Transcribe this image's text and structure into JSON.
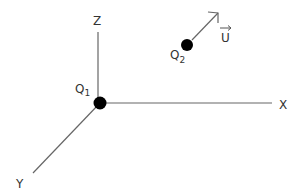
{
  "diagram": {
    "axes": {
      "z_label": "Z",
      "x_label": "X",
      "y_label": "Y"
    },
    "charges": [
      {
        "name": "Q",
        "subscript": "1"
      },
      {
        "name": "Q",
        "subscript": "2"
      }
    ],
    "vector": {
      "label": "U"
    },
    "colors": {
      "line": "#666666",
      "dot": "#000000",
      "text": "#333333"
    }
  }
}
